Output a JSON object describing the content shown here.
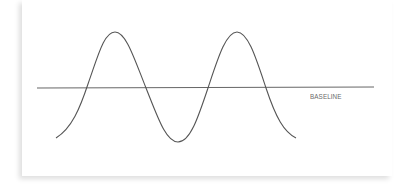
{
  "diagram": {
    "baseline_label": "BASELINE",
    "colors": {
      "line": "#555555",
      "baseline": "#666666",
      "label": "#6a6a6a",
      "background": "#ffffff"
    },
    "baseline": {
      "x1": 37,
      "x2": 374,
      "y": 88
    },
    "wave": {
      "type": "sine",
      "start": [
        56,
        138
      ],
      "peaks": [
        [
          115,
          32
        ],
        [
          237,
          32
        ]
      ],
      "troughs": [
        [
          178,
          142
        ]
      ],
      "end": [
        296,
        138
      ]
    }
  }
}
